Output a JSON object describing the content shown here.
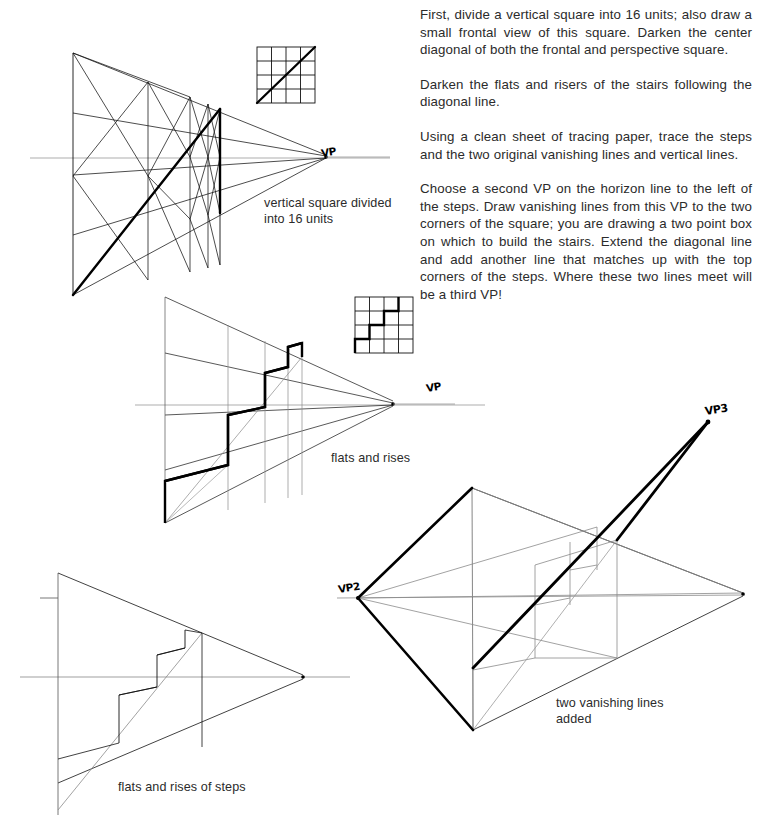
{
  "page": {
    "background_color": "#ffffff",
    "ink_color": "#000000",
    "width": 757,
    "height": 837
  },
  "instructions": {
    "paragraphs": [
      "First, divide a vertical square into 16 units; also draw a small frontal view of this square. Darken the center diagonal of both the frontal and perspective square.",
      "Darken the flats and risers of the stairs following the diagonal line.",
      "Using a clean sheet of tracing paper, trace the steps and the two original vanishing lines and vertical lines.",
      "Choose a second VP on the horizon line to the left of the steps. Draw vanishing lines from this VP to the two corners of the square; you are drawing a two point box on which to build the stairs. Extend the diagonal line and add another line that matches up with the top corners of the steps. Where these two lines meet will be a third VP!"
    ]
  },
  "figures": {
    "fig1": {
      "caption": "vertical square divided\ninto 16 units",
      "vp_label": "VP",
      "description": "perspective square divided into 16 units with bold center diagonal",
      "grid_units": 16
    },
    "fig2": {
      "caption": "flats and rises",
      "vp_label": "VP",
      "description": "perspective square with bold staircase of flats and risers following the diagonal",
      "steps": 4
    },
    "fig3": {
      "caption": "flats and rises of steps",
      "vp_label": "",
      "description": "traced steps with the two original vanishing lines and vertical lines"
    },
    "fig4": {
      "caption": "two vanishing lines\nadded",
      "vp_left_label": "VP2",
      "vp_third_label": "VP3",
      "description": "two point box built from second VP with extended diagonal meeting a third VP"
    },
    "inset1": {
      "description": "small frontal 4x4 square with bold diagonal",
      "grid": 4
    },
    "inset2": {
      "description": "small frontal 4x4 square with bold staircase outline",
      "grid": 4
    }
  }
}
